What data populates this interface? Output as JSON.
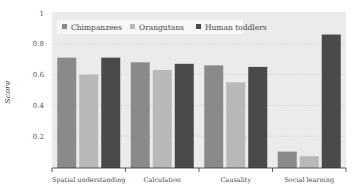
{
  "chart_data": {
    "type": "bar",
    "title": "",
    "xlabel": "",
    "ylabel": "Score",
    "ylim": [
      0,
      1
    ],
    "yticks": [
      0.2,
      0.4,
      0.6,
      0.8,
      1
    ],
    "ytick_labels": [
      "0.2",
      "0.4",
      "0.6",
      "0.8",
      "1"
    ],
    "grid": "horizontal dotted",
    "legend_position": "top-left inside",
    "categories": [
      "Spatial understanding",
      "Calculation",
      "Causality",
      "Social learning"
    ],
    "series": [
      {
        "name": "Chimpanzees",
        "color": "#8a8a8a",
        "values": [
          0.71,
          0.68,
          0.66,
          0.1
        ]
      },
      {
        "name": "Orangutans",
        "color": "#b8b8b8",
        "values": [
          0.6,
          0.63,
          0.55,
          0.07
        ]
      },
      {
        "name": "Human toddlers",
        "color": "#4a4a4a",
        "values": [
          0.71,
          0.67,
          0.65,
          0.86
        ]
      }
    ]
  },
  "colors": {
    "plot_background": "#ebebeb",
    "legend_background": "#f7f7f7",
    "axis": "#333333"
  }
}
